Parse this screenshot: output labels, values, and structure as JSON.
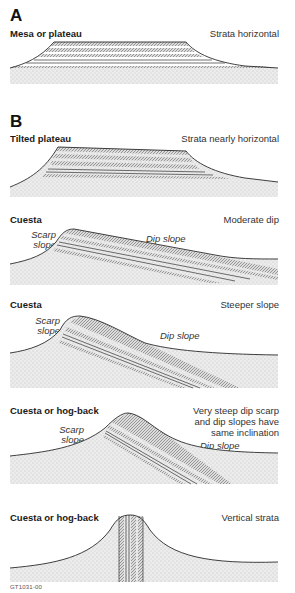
{
  "figure": {
    "code": "GT1031-00",
    "colors": {
      "outline": "#2a2a2a",
      "strata_hatch": "#555555",
      "ground_stipple": "#cfcfcf",
      "background": "#ffffff"
    }
  },
  "sections": {
    "A": {
      "letter": "A",
      "panels": [
        {
          "title": "Mesa or plateau",
          "description": "Strata horizontal"
        }
      ]
    },
    "B": {
      "letter": "B",
      "panels": [
        {
          "title": "Tilted plateau",
          "description": "Strata nearly horizontal"
        },
        {
          "title": "Cuesta",
          "description": "Moderate dip",
          "scarp_label_1": "Scarp",
          "scarp_label_2": "slope",
          "dip_label": "Dip slope"
        },
        {
          "title": "Cuesta",
          "description": "Steeper slope",
          "scarp_label_1": "Scarp",
          "scarp_label_2": "slope",
          "dip_label": "Dip slope"
        },
        {
          "title": "Cuesta or hog-back",
          "description_1": "Very steep dip scarp",
          "description_2": "and dip slopes have",
          "description_3": "same inclination",
          "scarp_label_1": "Scarp",
          "scarp_label_2": "slope",
          "dip_label": "Dip slope"
        },
        {
          "title": "Cuesta or hog-back",
          "description": "Vertical strata"
        }
      ]
    }
  }
}
